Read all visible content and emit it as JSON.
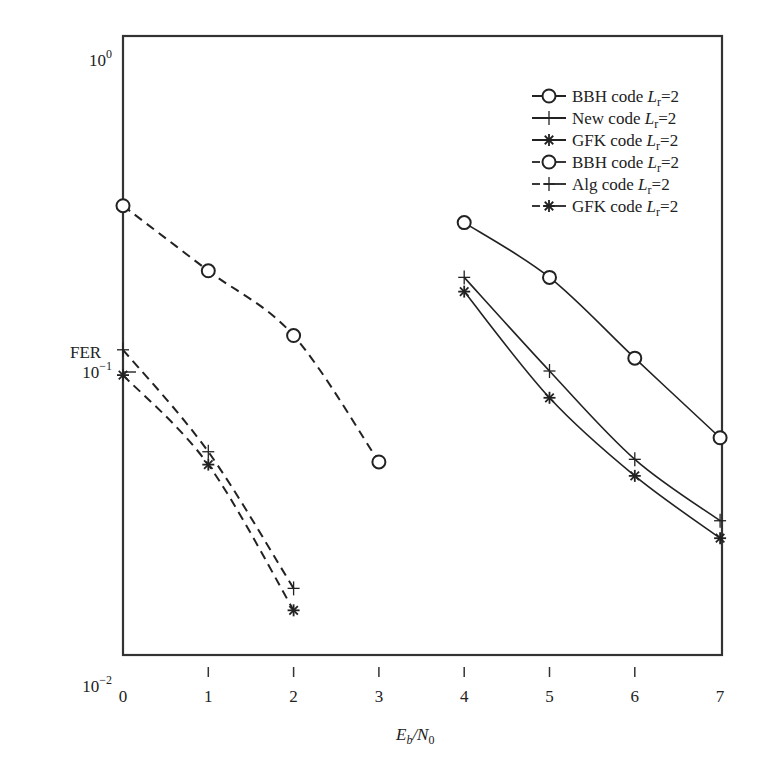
{
  "chart_data": {
    "type": "line",
    "title": "",
    "xlabel": "E_b/N_0",
    "xlabel_parts": {
      "main": "E",
      "sub1": "b",
      "sep": "/N",
      "sub2": "0"
    },
    "ylabel": "FER",
    "yscale": "log",
    "xlim": [
      0,
      7
    ],
    "ylim": [
      0.01,
      1
    ],
    "x_ticks": [
      "0",
      "1",
      "2",
      "3",
      "4",
      "5",
      "6",
      "7"
    ],
    "y_ticks": [
      {
        "value": 1,
        "base": "10",
        "exp": "0"
      },
      {
        "value": 0.1,
        "base": "10",
        "exp": "−1"
      },
      {
        "value": 0.01,
        "base": "10",
        "exp": "−2"
      }
    ],
    "grid": false,
    "legend_position": "upper right",
    "series": [
      {
        "name": "BBH code L_r=2",
        "label": "BBH code",
        "param": "L",
        "param_sub": "r",
        "param_val": "=2",
        "style": "solid",
        "marker": "circle",
        "x": [
          4,
          5,
          6,
          7
        ],
        "values": [
          0.3,
          0.2,
          0.11,
          0.061
        ]
      },
      {
        "name": "New code L_r=2",
        "label": "New code",
        "param": "L",
        "param_sub": "r",
        "param_val": "=2",
        "style": "solid",
        "marker": "plus",
        "x": [
          4,
          5,
          6,
          7
        ],
        "values": [
          0.2,
          0.1,
          0.052,
          0.033
        ]
      },
      {
        "name": "GFK code L_r=2",
        "label": "GFK code",
        "param": "L",
        "param_sub": "r",
        "param_val": "=2",
        "style": "solid",
        "marker": "asterisk",
        "x": [
          4,
          5,
          6,
          7
        ],
        "values": [
          0.18,
          0.082,
          0.046,
          0.029
        ]
      },
      {
        "name": "BBH code L_r=2",
        "label": "BBH code",
        "param": "L",
        "param_sub": "r",
        "param_val": "=2",
        "style": "dashed",
        "marker": "circle",
        "x": [
          0,
          1,
          2,
          3
        ],
        "values": [
          0.34,
          0.21,
          0.13,
          0.051
        ]
      },
      {
        "name": "Alg code L_r=2",
        "label": "Alg code ",
        "param": "L",
        "param_sub": "r",
        "param_val": "=2",
        "style": "dashed",
        "marker": "plus",
        "x": [
          0,
          1,
          2
        ],
        "values": [
          0.117,
          0.055,
          0.02
        ]
      },
      {
        "name": "GFK code L_r=2",
        "label": "GFK code",
        "param": "L",
        "param_sub": "r",
        "param_val": "=2",
        "style": "dashed",
        "marker": "asterisk",
        "x": [
          0,
          1,
          2
        ],
        "values": [
          0.097,
          0.05,
          0.017
        ]
      }
    ]
  },
  "colors": {
    "line": "#222222",
    "frame": "#333333",
    "background": "#ffffff"
  }
}
